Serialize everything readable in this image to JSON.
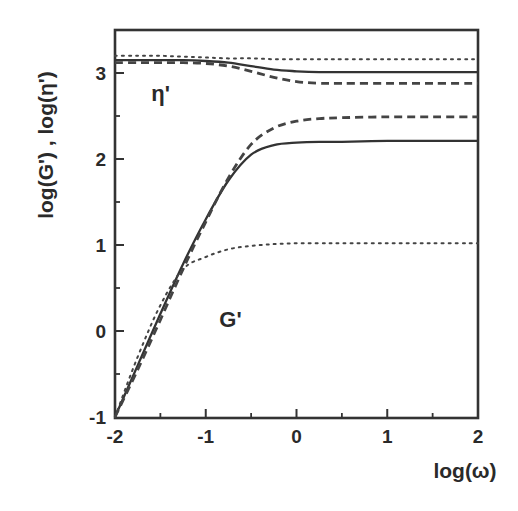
{
  "chart_data": {
    "type": "line",
    "title": "",
    "xlabel": "log(ω)",
    "ylabel": "log(G') , log(η')",
    "xlim": [
      -2,
      2
    ],
    "ylim": [
      -1,
      3.5
    ],
    "grid": false,
    "legend": null,
    "x_ticks": [
      "-2",
      "-1",
      "0",
      "1",
      "2"
    ],
    "x_minor_ticks": [
      -1.5,
      -0.5,
      0.5,
      1.5
    ],
    "y_ticks": [
      "-1",
      "0",
      "1",
      "2",
      "3"
    ],
    "y_minor_ticks": [
      -0.5,
      0.5,
      1.5,
      2.5
    ],
    "annotations": [
      {
        "text": "η'",
        "x": -1.6,
        "y": 2.68
      },
      {
        "text": "G'",
        "x": -0.85,
        "y": 0.05
      }
    ],
    "x": [
      -2.0,
      -1.75,
      -1.5,
      -1.25,
      -1.0,
      -0.75,
      -0.5,
      -0.25,
      0.0,
      0.25,
      0.5,
      1.0,
      1.5,
      2.0
    ],
    "series": [
      {
        "name": "G' (solid)",
        "style": "solid",
        "values": [
          -1.0,
          -0.4,
          0.2,
          0.78,
          1.3,
          1.75,
          2.05,
          2.16,
          2.19,
          2.2,
          2.2,
          2.21,
          2.21,
          2.21
        ]
      },
      {
        "name": "G' (dashed)",
        "style": "dashed",
        "values": [
          -1.0,
          -0.45,
          0.13,
          0.72,
          1.27,
          1.78,
          2.17,
          2.36,
          2.44,
          2.47,
          2.48,
          2.49,
          2.49,
          2.49
        ]
      },
      {
        "name": "G' (dotted)",
        "style": "dotted",
        "values": [
          -1.0,
          -0.3,
          0.3,
          0.72,
          0.86,
          0.95,
          0.99,
          1.01,
          1.02,
          1.02,
          1.02,
          1.02,
          1.02,
          1.02
        ]
      },
      {
        "name": "η' (solid)",
        "style": "solid",
        "values": [
          3.15,
          3.15,
          3.15,
          3.15,
          3.14,
          3.12,
          3.08,
          3.04,
          3.02,
          3.01,
          3.01,
          3.01,
          3.01,
          3.01
        ]
      },
      {
        "name": "η' (dashed)",
        "style": "dashed",
        "values": [
          3.12,
          3.12,
          3.12,
          3.12,
          3.11,
          3.08,
          3.02,
          2.95,
          2.9,
          2.88,
          2.88,
          2.88,
          2.88,
          2.88
        ]
      },
      {
        "name": "η' (dotted)",
        "style": "dotted",
        "values": [
          3.2,
          3.2,
          3.2,
          3.19,
          3.18,
          3.17,
          3.17,
          3.16,
          3.16,
          3.16,
          3.16,
          3.16,
          3.16,
          3.16
        ]
      }
    ]
  }
}
